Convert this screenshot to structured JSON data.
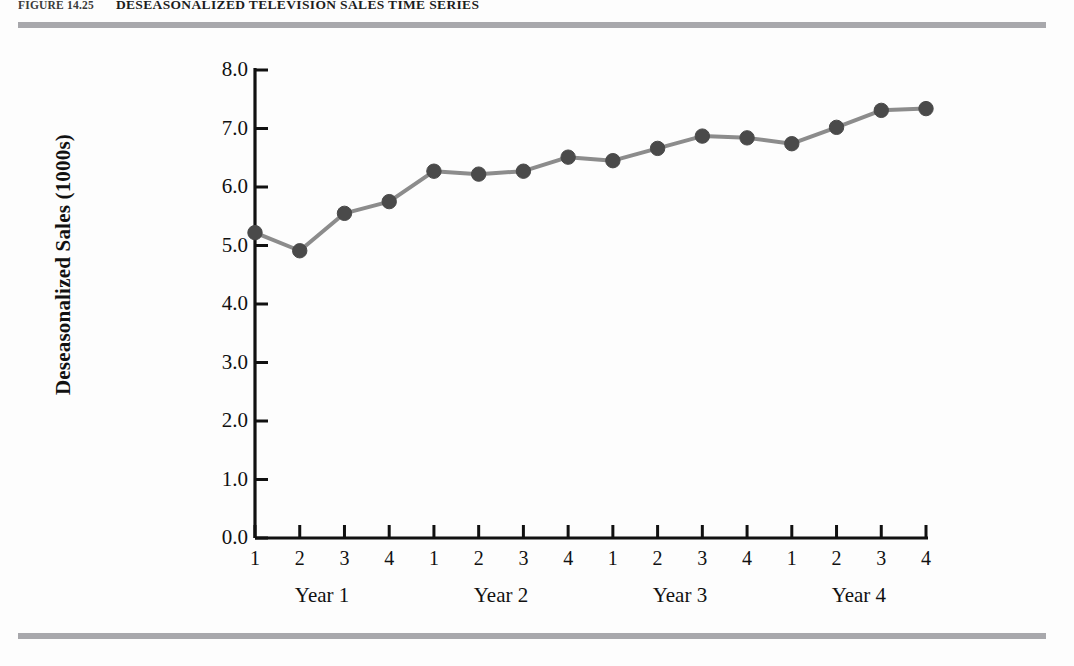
{
  "figure": {
    "number": "FIGURE 14.25",
    "title": "DESEASONALIZED TELEVISION SALES TIME SERIES"
  },
  "colors": {
    "rule": "#a8a8ac",
    "axis": "#111111",
    "marker": "#4a4a4a",
    "line": "#8c8c8c",
    "background": "#fdfdfd"
  },
  "chart_data": {
    "type": "line",
    "title": "DESEASONALIZED TELEVISION SALES TIME SERIES",
    "xlabel": "",
    "ylabel": "Deseasonalized Sales (1000s)",
    "ylim": [
      0.0,
      8.0
    ],
    "ytick_labels": [
      "0.0",
      "1.0",
      "2.0",
      "3.0",
      "4.0",
      "5.0",
      "6.0",
      "7.0",
      "8.0"
    ],
    "ytick_values": [
      0.0,
      1.0,
      2.0,
      3.0,
      4.0,
      5.0,
      6.0,
      7.0,
      8.0
    ],
    "grid": false,
    "legend": null,
    "categories": [
      "1",
      "2",
      "3",
      "4",
      "1",
      "2",
      "3",
      "4",
      "1",
      "2",
      "3",
      "4",
      "1",
      "2",
      "3",
      "4"
    ],
    "group_labels": [
      "Year 1",
      "Year 2",
      "Year 3",
      "Year 4"
    ],
    "values": [
      5.22,
      4.91,
      5.55,
      5.75,
      6.27,
      6.22,
      6.27,
      6.51,
      6.45,
      6.66,
      6.87,
      6.84,
      6.74,
      7.02,
      7.31,
      7.34
    ],
    "marker": "filled-circle",
    "xlim_index": [
      1,
      16
    ]
  }
}
